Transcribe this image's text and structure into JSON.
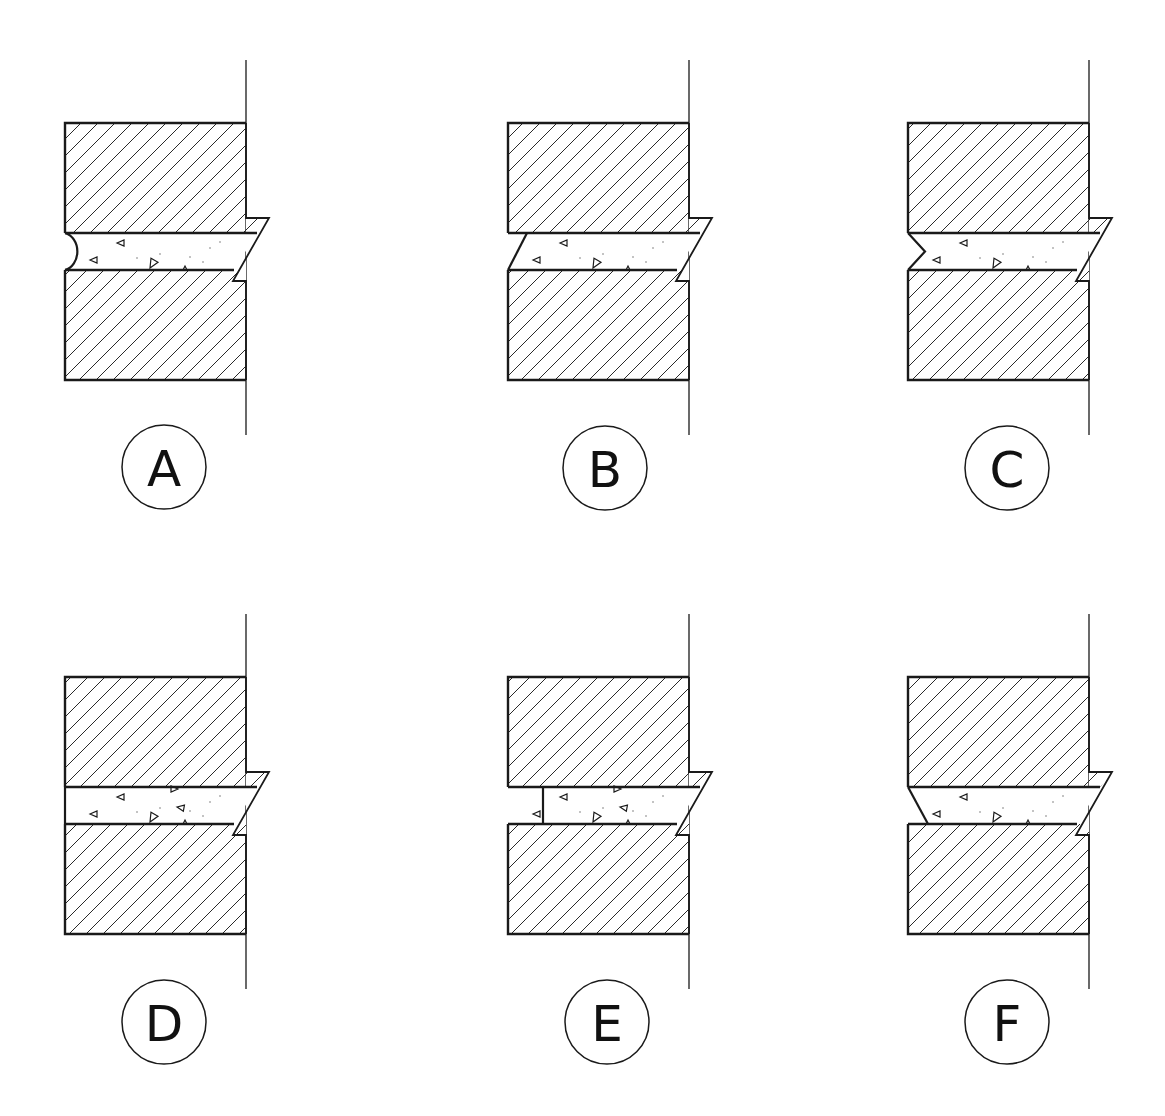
{
  "figure": {
    "colors": {
      "stroke": "#1a1a1a",
      "hatch": "#2a2a2a",
      "mortar_fill": "#ffffff",
      "background": "#ffffff"
    },
    "panels": [
      {
        "id": "A",
        "label": "A",
        "joint_type": "concave",
        "x": 65,
        "y": 123,
        "label_cx": 164,
        "label_cy": 467
      },
      {
        "id": "B",
        "label": "B",
        "joint_type": "weathered",
        "x": 508,
        "y": 123,
        "label_cx": 605,
        "label_cy": 468
      },
      {
        "id": "C",
        "label": "C",
        "joint_type": "v-shaped",
        "x": 908,
        "y": 123,
        "label_cx": 1007,
        "label_cy": 468
      },
      {
        "id": "D",
        "label": "D",
        "joint_type": "flush",
        "x": 65,
        "y": 677,
        "label_cx": 164,
        "label_cy": 1022
      },
      {
        "id": "E",
        "label": "E",
        "joint_type": "raked",
        "x": 508,
        "y": 677,
        "label_cx": 607,
        "label_cy": 1022
      },
      {
        "id": "F",
        "label": "F",
        "joint_type": "struck",
        "x": 908,
        "y": 677,
        "label_cx": 1007,
        "label_cy": 1022
      }
    ]
  }
}
